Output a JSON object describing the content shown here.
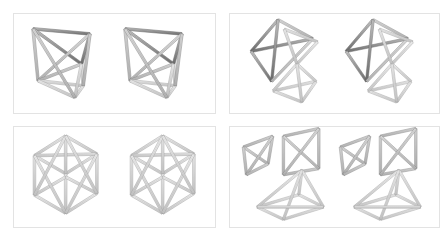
{
  "figure": {
    "title": "Stereo pairs of polyhedral strut-frame structures",
    "layout": "2x2 grid of bordered panels, each panel shows the same structure rendered twice side-by-side as a stereoscopic pair",
    "background_color": "#ffffff",
    "panel_border_color": "#e3e3e3",
    "strut_light_color": "#f2f2f2",
    "strut_mid_color": "#b8b8b8",
    "strut_dark_color": "#6e6e6e",
    "strut_outline_color": "#5a5a5a"
  },
  "panels": [
    {
      "id": "panel-a",
      "position": "top-left",
      "name": "octahedral-bipyramid-frame",
      "description": "Single triangular-antiprism / bipyramid truss: an upper dark-shaded triangular frame, a lower light-shaded triangular frame, joined by crossing diagonal struts",
      "view_count": 2,
      "views": [
        "left-eye-view",
        "right-eye-view"
      ]
    },
    {
      "id": "panel-b",
      "position": "top-right",
      "name": "paired-tetrahedra-frame",
      "description": "Two interlocking tetrahedral strut frames; the upper-left tetrahedron is dark shaded and the lower-right tetrahedron is light shaded, linked at a shared vertex region",
      "view_count": 2,
      "views": [
        "left-eye-view",
        "right-eye-view"
      ]
    },
    {
      "id": "panel-c",
      "position": "bottom-left",
      "name": "cubic-cage-frame",
      "description": "Cube-shaped cage assembled from six square strut frames with internal diagonal bracing, drawn in light gray with open faces",
      "view_count": 2,
      "views": [
        "left-eye-view",
        "right-eye-view"
      ]
    },
    {
      "id": "panel-d",
      "position": "bottom-right",
      "name": "exploded-frame-components",
      "description": "Three separated frame components: a small triangular frame with internal bracing at left, a square frame with X-shaped cross bracing at upper right, and a four-sided pyramid frame below",
      "view_count": 2,
      "views": [
        "left-eye-view",
        "right-eye-view"
      ]
    }
  ],
  "geometry": {
    "panel_a_struts": [
      {
        "a": [
          12,
          10
        ],
        "b": [
          80,
          16
        ],
        "shade": "dark"
      },
      {
        "a": [
          80,
          16
        ],
        "b": [
          70,
          52
        ],
        "shade": "dark"
      },
      {
        "a": [
          70,
          52
        ],
        "b": [
          12,
          10
        ],
        "shade": "dark"
      },
      {
        "a": [
          12,
          10
        ],
        "b": [
          18,
          72
        ],
        "shade": "mid"
      },
      {
        "a": [
          80,
          16
        ],
        "b": [
          18,
          72
        ],
        "shade": "mid"
      },
      {
        "a": [
          70,
          52
        ],
        "b": [
          18,
          72
        ],
        "shade": "mid"
      },
      {
        "a": [
          18,
          72
        ],
        "b": [
          72,
          78
        ],
        "shade": "light"
      },
      {
        "a": [
          72,
          78
        ],
        "b": [
          62,
          92
        ],
        "shade": "light"
      },
      {
        "a": [
          62,
          92
        ],
        "b": [
          18,
          72
        ],
        "shade": "light"
      },
      {
        "a": [
          70,
          52
        ],
        "b": [
          72,
          78
        ],
        "shade": "light"
      },
      {
        "a": [
          70,
          52
        ],
        "b": [
          62,
          92
        ],
        "shade": "light"
      },
      {
        "a": [
          80,
          16
        ],
        "b": [
          72,
          78
        ],
        "shade": "mid"
      },
      {
        "a": [
          12,
          10
        ],
        "b": [
          62,
          92
        ],
        "shade": "mid"
      }
    ],
    "panel_b_struts": [
      {
        "a": [
          14,
          46
        ],
        "b": [
          48,
          6
        ],
        "shade": "dark"
      },
      {
        "a": [
          48,
          6
        ],
        "b": [
          92,
          30
        ],
        "shade": "mid"
      },
      {
        "a": [
          92,
          30
        ],
        "b": [
          14,
          46
        ],
        "shade": "dark"
      },
      {
        "a": [
          14,
          46
        ],
        "b": [
          40,
          84
        ],
        "shade": "dark"
      },
      {
        "a": [
          48,
          6
        ],
        "b": [
          40,
          84
        ],
        "shade": "dark"
      },
      {
        "a": [
          92,
          30
        ],
        "b": [
          40,
          84
        ],
        "shade": "mid"
      },
      {
        "a": [
          56,
          18
        ],
        "b": [
          98,
          34
        ],
        "shade": "light"
      },
      {
        "a": [
          98,
          34
        ],
        "b": [
          72,
          62
        ],
        "shade": "light"
      },
      {
        "a": [
          72,
          62
        ],
        "b": [
          56,
          18
        ],
        "shade": "light"
      },
      {
        "a": [
          42,
          96
        ],
        "b": [
          96,
          84
        ],
        "shade": "light"
      },
      {
        "a": [
          96,
          84
        ],
        "b": [
          78,
          110
        ],
        "shade": "light"
      },
      {
        "a": [
          78,
          110
        ],
        "b": [
          42,
          96
        ],
        "shade": "light"
      },
      {
        "a": [
          72,
          62
        ],
        "b": [
          42,
          96
        ],
        "shade": "light"
      },
      {
        "a": [
          72,
          62
        ],
        "b": [
          96,
          84
        ],
        "shade": "light"
      },
      {
        "a": [
          72,
          62
        ],
        "b": [
          78,
          110
        ],
        "shade": "light"
      }
    ],
    "panel_c_struts": [
      {
        "a": [
          20,
          30
        ],
        "b": [
          58,
          6
        ],
        "shade": "light"
      },
      {
        "a": [
          58,
          6
        ],
        "b": [
          96,
          28
        ],
        "shade": "light"
      },
      {
        "a": [
          96,
          28
        ],
        "b": [
          58,
          52
        ],
        "shade": "light"
      },
      {
        "a": [
          58,
          52
        ],
        "b": [
          20,
          30
        ],
        "shade": "light"
      },
      {
        "a": [
          20,
          30
        ],
        "b": [
          96,
          28
        ],
        "shade": "light"
      },
      {
        "a": [
          58,
          6
        ],
        "b": [
          58,
          52
        ],
        "shade": "light"
      },
      {
        "a": [
          20,
          30
        ],
        "b": [
          20,
          78
        ],
        "shade": "light"
      },
      {
        "a": [
          58,
          52
        ],
        "b": [
          58,
          100
        ],
        "shade": "light"
      },
      {
        "a": [
          96,
          28
        ],
        "b": [
          96,
          76
        ],
        "shade": "light"
      },
      {
        "a": [
          20,
          78
        ],
        "b": [
          58,
          100
        ],
        "shade": "light"
      },
      {
        "a": [
          58,
          100
        ],
        "b": [
          96,
          76
        ],
        "shade": "light"
      },
      {
        "a": [
          20,
          78
        ],
        "b": [
          58,
          56
        ],
        "shade": "light"
      },
      {
        "a": [
          96,
          76
        ],
        "b": [
          58,
          56
        ],
        "shade": "light"
      },
      {
        "a": [
          20,
          30
        ],
        "b": [
          58,
          100
        ],
        "shade": "light"
      },
      {
        "a": [
          96,
          28
        ],
        "b": [
          58,
          100
        ],
        "shade": "light"
      },
      {
        "a": [
          20,
          78
        ],
        "b": [
          58,
          6
        ],
        "shade": "light"
      },
      {
        "a": [
          96,
          76
        ],
        "b": [
          58,
          6
        ],
        "shade": "light"
      }
    ],
    "panel_d_struts": [
      {
        "a": [
          6,
          26
        ],
        "b": [
          44,
          12
        ],
        "shade": "mid"
      },
      {
        "a": [
          44,
          12
        ],
        "b": [
          38,
          48
        ],
        "shade": "mid"
      },
      {
        "a": [
          38,
          48
        ],
        "b": [
          6,
          26
        ],
        "shade": "mid"
      },
      {
        "a": [
          6,
          26
        ],
        "b": [
          10,
          62
        ],
        "shade": "mid"
      },
      {
        "a": [
          44,
          12
        ],
        "b": [
          10,
          62
        ],
        "shade": "mid"
      },
      {
        "a": [
          38,
          48
        ],
        "b": [
          10,
          62
        ],
        "shade": "mid"
      },
      {
        "a": [
          58,
          12
        ],
        "b": [
          104,
          2
        ],
        "shade": "mid"
      },
      {
        "a": [
          104,
          2
        ],
        "b": [
          104,
          54
        ],
        "shade": "mid"
      },
      {
        "a": [
          104,
          54
        ],
        "b": [
          58,
          62
        ],
        "shade": "mid"
      },
      {
        "a": [
          58,
          62
        ],
        "b": [
          58,
          12
        ],
        "shade": "mid"
      },
      {
        "a": [
          58,
          12
        ],
        "b": [
          104,
          54
        ],
        "shade": "mid"
      },
      {
        "a": [
          104,
          2
        ],
        "b": [
          58,
          62
        ],
        "shade": "mid"
      },
      {
        "a": [
          24,
          104
        ],
        "b": [
          78,
          88
        ],
        "shade": "light"
      },
      {
        "a": [
          78,
          88
        ],
        "b": [
          110,
          104
        ],
        "shade": "light"
      },
      {
        "a": [
          110,
          104
        ],
        "b": [
          58,
          120
        ],
        "shade": "light"
      },
      {
        "a": [
          58,
          120
        ],
        "b": [
          24,
          104
        ],
        "shade": "light"
      },
      {
        "a": [
          24,
          104
        ],
        "b": [
          82,
          56
        ],
        "shade": "light"
      },
      {
        "a": [
          78,
          88
        ],
        "b": [
          82,
          56
        ],
        "shade": "light"
      },
      {
        "a": [
          110,
          104
        ],
        "b": [
          82,
          56
        ],
        "shade": "light"
      },
      {
        "a": [
          58,
          120
        ],
        "b": [
          82,
          56
        ],
        "shade": "light"
      },
      {
        "a": [
          24,
          104
        ],
        "b": [
          110,
          104
        ],
        "shade": "light"
      }
    ]
  }
}
